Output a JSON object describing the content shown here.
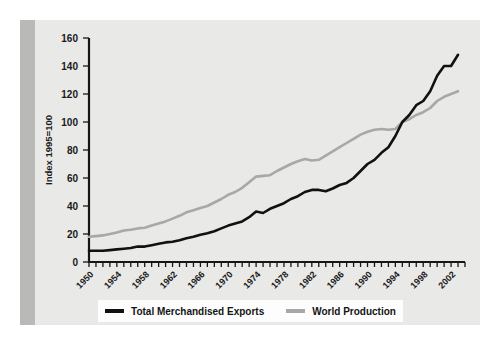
{
  "figure": {
    "background_color": "#e9e9e7",
    "gutter_color": "#b9b9b7",
    "legend_background": "#fdfdfd"
  },
  "legend": {
    "position": "bottom",
    "entries": [
      {
        "label": "Total Merchandised Exports",
        "color": "#111111",
        "swatch": "line-swatch-black"
      },
      {
        "label": "World Production",
        "color": "#a8a8a8",
        "swatch": "line-swatch-gray"
      }
    ]
  },
  "chart_data": {
    "type": "line",
    "title": "",
    "subtitle": "",
    "xlabel": "",
    "ylabel": "Index 1995=100",
    "xlim": [
      1950,
      2004
    ],
    "ylim": [
      0,
      160
    ],
    "yticks": [
      0,
      20,
      40,
      60,
      80,
      100,
      120,
      140,
      160
    ],
    "ytick_labels": [
      "0",
      "20",
      "40",
      "60",
      "80",
      "100",
      "120",
      "140",
      "160"
    ],
    "xtick_labels": [
      "1950",
      "1954",
      "1958",
      "1962",
      "1966",
      "1970",
      "1974",
      "1978",
      "1982",
      "1986",
      "1990",
      "1994",
      "1998",
      "2002"
    ],
    "xtick_label_years": [
      1950,
      1954,
      1958,
      1962,
      1966,
      1970,
      1974,
      1978,
      1982,
      1986,
      1990,
      1994,
      1998,
      2002
    ],
    "minor_tick_interval_years": 1,
    "grid": false,
    "x": [
      1950,
      1951,
      1952,
      1953,
      1954,
      1955,
      1956,
      1957,
      1958,
      1959,
      1960,
      1961,
      1962,
      1963,
      1964,
      1965,
      1966,
      1967,
      1968,
      1969,
      1970,
      1971,
      1972,
      1973,
      1974,
      1975,
      1976,
      1977,
      1978,
      1979,
      1980,
      1981,
      1982,
      1983,
      1984,
      1985,
      1986,
      1987,
      1988,
      1989,
      1990,
      1991,
      1992,
      1993,
      1994,
      1995,
      1996,
      1997,
      1998,
      1999,
      2000,
      2001,
      2002,
      2003
    ],
    "series": [
      {
        "name": "Total Merchandised Exports",
        "color": "#111111",
        "values": [
          8,
          8,
          8,
          8.5,
          9,
          9.5,
          10,
          11,
          11,
          12,
          13,
          14,
          14.5,
          15.5,
          17,
          18,
          19.5,
          20.5,
          22,
          24,
          26,
          27.5,
          29,
          32,
          36,
          35,
          38,
          40,
          42,
          45,
          47,
          50,
          51.5,
          51.5,
          50.5,
          52.5,
          55,
          56.5,
          60,
          65,
          70,
          73,
          78,
          82,
          90,
          100,
          105,
          112,
          115,
          122,
          133,
          140,
          140,
          148
        ]
      },
      {
        "name": "World Production",
        "color": "#a8a8a8",
        "values": [
          18,
          18.5,
          19,
          20,
          21,
          22.5,
          23,
          24,
          24.5,
          26,
          27.5,
          29,
          31,
          33,
          35.5,
          37,
          38.5,
          40,
          42.5,
          45,
          48,
          50,
          53,
          57,
          61,
          61.5,
          62,
          65,
          67.5,
          70,
          72,
          73.5,
          72.5,
          73,
          76,
          79,
          82,
          85,
          88,
          91,
          93,
          94.5,
          95,
          94.5,
          95,
          100,
          102,
          105,
          107,
          110,
          115,
          118,
          120,
          122
        ]
      }
    ]
  }
}
